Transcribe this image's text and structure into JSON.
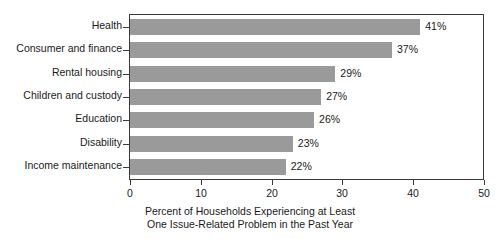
{
  "chart_data": {
    "type": "bar",
    "orientation": "horizontal",
    "title": "",
    "xlabel_line1": "Percent of Households Experiencing at Least",
    "xlabel_line2": "One Issue-Related Problem in the Past Year",
    "ylabel": "",
    "categories": [
      "Health",
      "Consumer and finance",
      "Rental housing",
      "Children and custody",
      "Education",
      "Disability",
      "Income maintenance"
    ],
    "values": [
      41,
      37,
      29,
      27,
      26,
      23,
      22
    ],
    "value_labels": [
      "41%",
      "37%",
      "29%",
      "27%",
      "26%",
      "23%",
      "22%"
    ],
    "xlim": [
      0,
      50
    ],
    "xticks": [
      0,
      10,
      20,
      30,
      40,
      50
    ],
    "xtick_labels": [
      "0",
      "10",
      "20",
      "30",
      "40",
      "50"
    ],
    "grid": false,
    "legend": false,
    "bar_color": "#9a9a9a",
    "frame_color": "#3a3a3a",
    "text_color": "#1a1a1a",
    "background": "#ffffff"
  }
}
